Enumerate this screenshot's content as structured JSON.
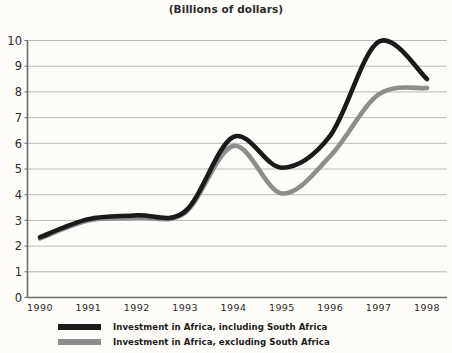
{
  "chart_data": {
    "type": "line",
    "title": "(Billions of dollars)",
    "xlabel": "",
    "ylabel": "",
    "xlim": [
      1989.75,
      1998.25
    ],
    "ylim": [
      0,
      10
    ],
    "grid": true,
    "legend_position": "bottom-left",
    "x_ticks": [
      "1990",
      "1991",
      "1992",
      "1993",
      "1994",
      "1995",
      "1996",
      "1997",
      "1998"
    ],
    "y_ticks": [
      "0",
      "1",
      "2",
      "3",
      "4",
      "5",
      "6",
      "7",
      "8",
      "9",
      "10"
    ],
    "x": [
      1990,
      1991,
      1992,
      1993,
      1994,
      1995,
      1996,
      1997,
      1998
    ],
    "series": [
      {
        "name": "Investment in Africa, including South Africa",
        "color": "#1a1a1a",
        "values": [
          2.35,
          3.05,
          3.2,
          3.35,
          6.25,
          5.05,
          6.3,
          9.95,
          8.5
        ]
      },
      {
        "name": "Investment in Africa, excluding South Africa",
        "color": "#8d8d8d",
        "values": [
          2.3,
          3.0,
          3.1,
          3.3,
          5.9,
          4.05,
          5.5,
          7.9,
          8.15
        ]
      }
    ],
    "colors": {
      "background": "#fdfcf8",
      "grid": "#b9b9b9",
      "axis": "#6d6d6d",
      "text": "#2b2b2b",
      "series_including": "#1a1a1a",
      "series_excluding": "#8d8d8d"
    }
  },
  "legend": {
    "items": [
      {
        "label": "Investment in Africa, including South Africa",
        "color": "#1a1a1a"
      },
      {
        "label": "Investment in Africa, excluding South Africa",
        "color": "#8d8d8d"
      }
    ]
  }
}
